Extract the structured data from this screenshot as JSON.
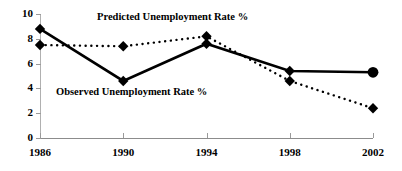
{
  "chart_data": {
    "type": "line",
    "title": "",
    "xlabel": "",
    "ylabel": "",
    "x": [
      1986,
      1990,
      1994,
      1998,
      2002
    ],
    "categories": [
      "1986",
      "1990",
      "1994",
      "1998",
      "2002"
    ],
    "xtick_labels": [
      "1986",
      "1990",
      "1994",
      "1998",
      "2002"
    ],
    "ytick_labels": [
      "0",
      "2",
      "4",
      "6",
      "8",
      "10"
    ],
    "yticks": [
      0,
      2,
      4,
      6,
      8,
      10
    ],
    "ylim": [
      0,
      10
    ],
    "xlim": [
      1986,
      2002
    ],
    "grid": false,
    "legend_position": "inline-annotations",
    "series": [
      {
        "name": "Observed Unemployment Rate %",
        "label": "Observed Unemployment Rate %",
        "style": "solid",
        "marker": "diamond",
        "last_marker": "circle",
        "color": "#000000",
        "values": [
          8.8,
          4.6,
          7.6,
          5.4,
          5.3
        ]
      },
      {
        "name": "Predicted Unemployment Rate %",
        "label": "Predicted Unemployment Rate %",
        "style": "dotted",
        "marker": "diamond",
        "color": "#000000",
        "values": [
          7.5,
          7.4,
          8.2,
          4.6,
          2.4
        ]
      }
    ],
    "annotations": [
      {
        "text": "Predicted Unemployment Rate %",
        "series": "predicted"
      },
      {
        "text": "Observed Unemployment Rate %",
        "series": "observed"
      }
    ],
    "axis_color": "#8c8c8c"
  }
}
